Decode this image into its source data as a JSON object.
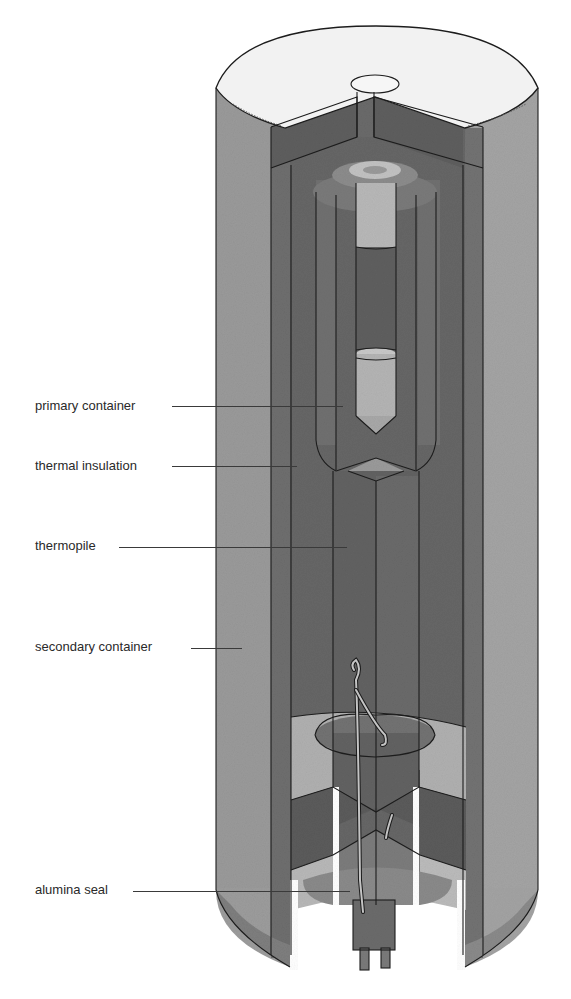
{
  "figure": {
    "labels": [
      {
        "id": "primary-container",
        "text": "primary container",
        "x": 35,
        "y": 398,
        "leader_x1": 172,
        "leader_x2": 343,
        "leader_y": 406
      },
      {
        "id": "thermal-insulation",
        "text": "thermal insulation",
        "x": 35,
        "y": 458,
        "leader_x1": 172,
        "leader_x2": 297,
        "leader_y": 466
      },
      {
        "id": "thermopile",
        "text": "thermopile",
        "x": 35,
        "y": 538,
        "leader_x1": 119,
        "leader_x2": 347,
        "leader_y": 547
      },
      {
        "id": "secondary-container",
        "text": "secondary container",
        "x": 35,
        "y": 639,
        "leader_x1": 191,
        "leader_x2": 242,
        "leader_y": 648
      },
      {
        "id": "alumina-seal",
        "text": "alumina seal",
        "x": 35,
        "y": 882,
        "leader_x1": 133,
        "leader_x2": 350,
        "leader_y": 891
      }
    ]
  },
  "colors": {
    "outer_shell": "#9c9c9c",
    "shell_dark": "#767676",
    "insulation": "#6b6b6b",
    "inner_dark": "#5f5f5f",
    "light_part": "#b5b5b5",
    "top_face": "#f1f1f1",
    "outline": "#1c1c1c"
  }
}
